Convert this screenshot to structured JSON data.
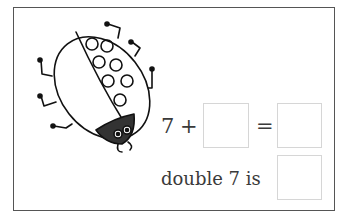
{
  "worksheet": {
    "illustration": "ladybug-with-seven-spots",
    "ladybug_spots": 7,
    "equation": {
      "addend": "7",
      "plus": "+",
      "equals": "=",
      "blank_addend": "",
      "blank_sum": ""
    },
    "double_prompt": {
      "label": "double 7 is",
      "blank_answer": ""
    }
  }
}
